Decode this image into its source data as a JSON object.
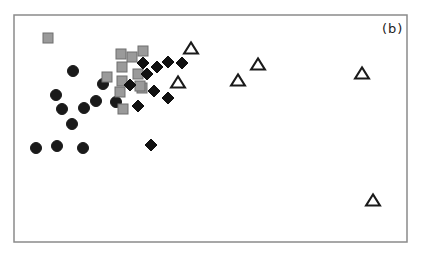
{
  "chart_data": {
    "type": "scatter",
    "title": "",
    "panel_label": "(b)",
    "xlabel": "",
    "ylabel": "",
    "axes_visible": false,
    "grid": false,
    "legend": null,
    "frame_px": {
      "left": 14,
      "top": 15,
      "right": 407,
      "bottom": 242
    },
    "note": "Coordinates are pixel positions within the screenshot (no axis ticks shown).",
    "series": [
      {
        "name": "circles",
        "marker": "circle",
        "fill": "#1a1a1a",
        "stroke": "#1a1a1a",
        "size": 11,
        "points": [
          [
            73,
            71
          ],
          [
            103,
            84
          ],
          [
            56,
            95
          ],
          [
            96,
            101
          ],
          [
            62,
            109
          ],
          [
            84,
            108
          ],
          [
            116,
            102
          ],
          [
            72,
            124
          ],
          [
            36,
            148
          ],
          [
            57,
            146
          ],
          [
            83,
            148
          ]
        ]
      },
      {
        "name": "squares",
        "marker": "square",
        "fill": "#9a9a9a",
        "stroke": "#6e6e6e",
        "size": 10,
        "points": [
          [
            48,
            38
          ],
          [
            121,
            54
          ],
          [
            132,
            57
          ],
          [
            143,
            51
          ],
          [
            122,
            67
          ],
          [
            107,
            77
          ],
          [
            122,
            81
          ],
          [
            138,
            74
          ],
          [
            142,
            88
          ],
          [
            120,
            92
          ],
          [
            123,
            109
          ],
          [
            140,
            86
          ]
        ]
      },
      {
        "name": "diamonds",
        "marker": "diamond",
        "fill": "#111111",
        "stroke": "#111111",
        "size": 12,
        "points": [
          [
            143,
            63
          ],
          [
            157,
            67
          ],
          [
            168,
            62
          ],
          [
            182,
            63
          ],
          [
            147,
            74
          ],
          [
            130,
            85
          ],
          [
            154,
            91
          ],
          [
            168,
            98
          ],
          [
            138,
            106
          ],
          [
            151,
            145
          ]
        ]
      },
      {
        "name": "triangles",
        "marker": "triangle-open",
        "fill": "none",
        "stroke": "#1a1a1a",
        "size": 14,
        "points": [
          [
            191,
            48
          ],
          [
            178,
            82
          ],
          [
            258,
            64
          ],
          [
            238,
            80
          ],
          [
            362,
            73
          ],
          [
            373,
            200
          ]
        ]
      }
    ]
  }
}
